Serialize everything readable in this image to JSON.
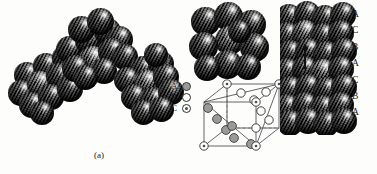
{
  "figure": {
    "background": "#fdfdfc",
    "width": 377,
    "height": 174,
    "type": "close-packed-crystal-structure-diagram"
  },
  "captions": {
    "panel_a": "(a)",
    "panel_b": "(b)"
  },
  "legend": {
    "title": "",
    "items": [
      {
        "label": "A",
        "marker": "filled-circle",
        "color": "#9a9a9a"
      },
      {
        "label": "B",
        "marker": "open-circle",
        "color": "#ffffff"
      },
      {
        "label": "C",
        "marker": "dotted-circle",
        "color": "#ffffff"
      }
    ]
  },
  "stacking_sequence": {
    "label": "stacking-sequence-labels",
    "letters": [
      "A",
      "C",
      "B",
      "A",
      "C",
      "B",
      "A"
    ]
  },
  "panel_a": {
    "name": "hexagonal-close-packed-clusters",
    "clusters": [
      {
        "name": "cluster-left",
        "sphere_count": 10
      },
      {
        "name": "cluster-middle",
        "sphere_count": 13
      },
      {
        "name": "cluster-right",
        "sphere_count": 12
      }
    ]
  },
  "panel_b": {
    "name": "face-centered-cubic-structure",
    "top_cluster": {
      "name": "fcc-close-packed-cluster",
      "sphere_count": 10
    },
    "unit_cell": {
      "name": "fcc-unit-cell",
      "corner_atoms": 8,
      "corner_marker": "dotted-circle",
      "face_atoms": 6,
      "face_marker": "open-circle",
      "plane_atoms": 6,
      "plane_marker": "filled-circle",
      "edge_style": "solid-and-dashed"
    },
    "stack_column": {
      "name": "abc-stacked-sphere-column",
      "rows": 7
    }
  },
  "colors": {
    "background": "#fdfdfc",
    "text": "#17171b",
    "cell_line": "#55555a",
    "filled_atom": "#9a9a9a",
    "open_atom": "#ffffff",
    "atom_outline": "#2e2e2e"
  }
}
